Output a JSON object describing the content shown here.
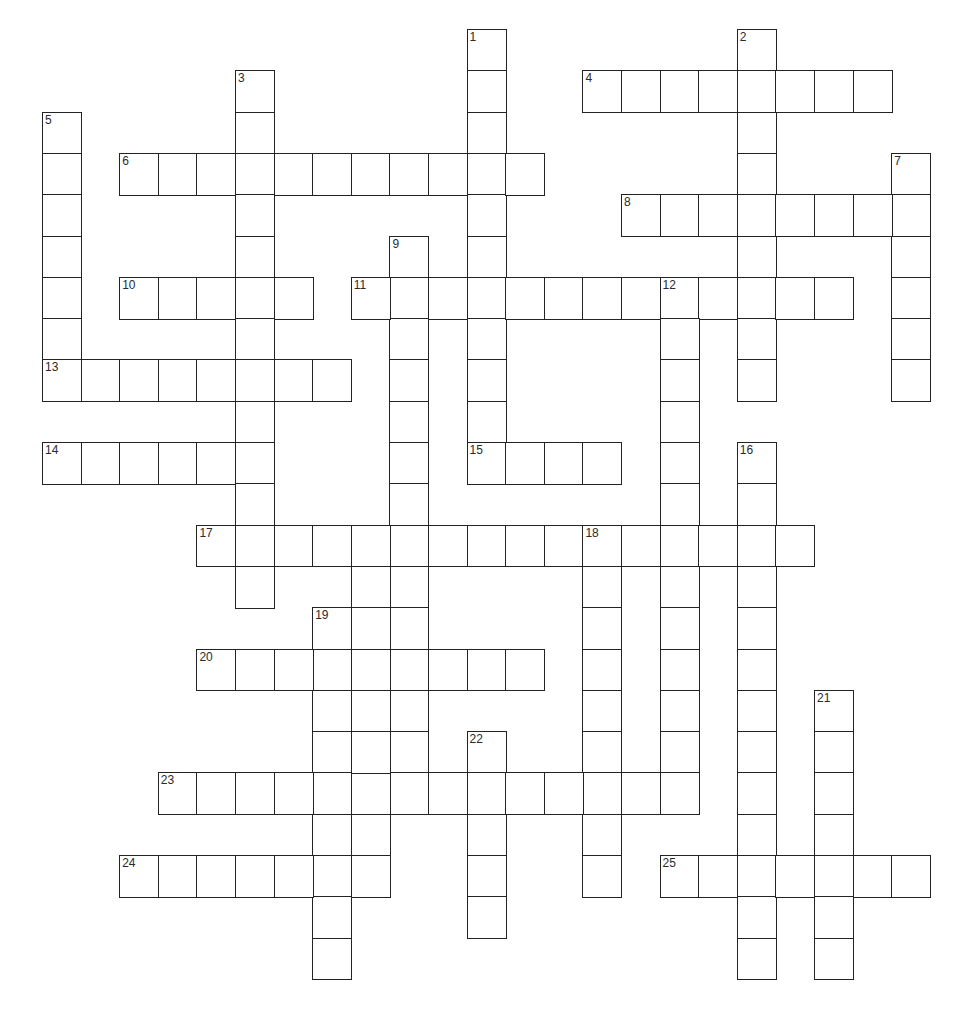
{
  "puzzle": {
    "type": "crossword",
    "grid_origin": {
      "x": 42,
      "y": 29
    },
    "cell_size": {
      "w": 38.6,
      "h": 41.3
    },
    "line_color": "#232323",
    "background": "#ffffff",
    "entries": [
      {
        "number": "1",
        "dir": "down",
        "col": 11,
        "row": 0,
        "length": 11
      },
      {
        "number": "2",
        "dir": "down",
        "col": 18,
        "row": 0,
        "length": 9
      },
      {
        "number": "3",
        "dir": "down",
        "col": 5,
        "row": 1,
        "length": 13
      },
      {
        "number": "4",
        "dir": "across",
        "col": 14,
        "row": 1,
        "length": 8
      },
      {
        "number": "5",
        "dir": "down",
        "col": 0,
        "row": 2,
        "length": 7
      },
      {
        "number": "6",
        "dir": "across",
        "col": 2,
        "row": 3,
        "length": 11
      },
      {
        "number": "7",
        "dir": "down",
        "col": 22,
        "row": 3,
        "length": 6
      },
      {
        "number": "8",
        "dir": "across",
        "col": 15,
        "row": 4,
        "length": 8
      },
      {
        "number": "9",
        "dir": "down",
        "col": 9,
        "row": 5,
        "length": 14
      },
      {
        "number": "10",
        "dir": "across",
        "col": 2,
        "row": 6,
        "length": 5
      },
      {
        "number": "11",
        "dir": "across",
        "col": 8,
        "row": 6,
        "length": 13
      },
      {
        "number": "12",
        "dir": "down",
        "col": 16,
        "row": 6,
        "length": 13
      },
      {
        "number": "13",
        "dir": "across",
        "col": 0,
        "row": 8,
        "length": 8
      },
      {
        "number": "14",
        "dir": "across",
        "col": 0,
        "row": 10,
        "length": 6
      },
      {
        "number": "15",
        "dir": "across",
        "col": 11,
        "row": 10,
        "length": 4
      },
      {
        "number": "16",
        "dir": "down",
        "col": 18,
        "row": 10,
        "length": 13
      },
      {
        "number": "17",
        "dir": "across",
        "col": 4,
        "row": 12,
        "length": 16
      },
      {
        "number": "18",
        "dir": "down",
        "col": 14,
        "row": 12,
        "length": 9
      },
      {
        "number": "19",
        "dir": "down",
        "col": 7,
        "row": 14,
        "length": 9
      },
      {
        "number": "20",
        "dir": "across",
        "col": 4,
        "row": 15,
        "length": 9
      },
      {
        "number": "21",
        "dir": "down",
        "col": 20,
        "row": 16,
        "length": 7
      },
      {
        "number": "22",
        "dir": "down",
        "col": 11,
        "row": 17,
        "length": 5
      },
      {
        "number": "23",
        "dir": "across",
        "col": 3,
        "row": 18,
        "length": 13
      },
      {
        "number": "24",
        "dir": "across",
        "col": 2,
        "row": 20,
        "length": 7
      },
      {
        "number": "25",
        "dir": "across",
        "col": 16,
        "row": 20,
        "length": 7
      },
      {
        "number": "",
        "dir": "down",
        "col": 8,
        "row": 12,
        "length": 9
      }
    ]
  }
}
